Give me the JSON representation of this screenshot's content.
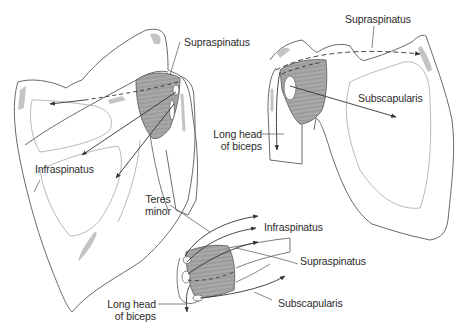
{
  "figure": {
    "colors": {
      "bone_outline": "#6a6a6a",
      "bone_inner": "#b0b0b0",
      "bone_shading": "#c4c4c4",
      "muscle_fill": "#a9a9a9",
      "muscle_lines": "#7a7a7a",
      "arrow": "#333333",
      "text": "#2b2b2b"
    },
    "views": [
      {
        "id": "posterior-view",
        "labels": {
          "supraspinatus": "Supraspinatus",
          "infraspinatus": "Infraspinatus",
          "teres_minor_line1": "Teres",
          "teres_minor_line2": "minor"
        }
      },
      {
        "id": "anterior-view",
        "labels": {
          "supraspinatus": "Supraspinatus",
          "subscapularis": "Subscapularis",
          "long_head_line1": "Long head",
          "long_head_line2": "of biceps"
        }
      },
      {
        "id": "superior-view",
        "labels": {
          "infraspinatus": "Infraspinatus",
          "supraspinatus": "Supraspinatus",
          "subscapularis": "Subscapularis",
          "long_head_line1": "Long head",
          "long_head_line2": "of biceps"
        }
      }
    ]
  }
}
